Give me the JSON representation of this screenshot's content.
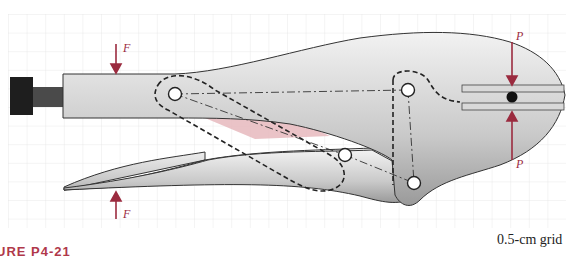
{
  "figure": {
    "caption": "URE P4-21",
    "grid_label": "0.5-cm grid",
    "forces": {
      "top_handle": "F",
      "bottom_handle": "F",
      "top_jaw": "P",
      "bottom_jaw": "P"
    },
    "colors": {
      "force_arrow": "#9b2b3f",
      "body_fill": "#c8c8c8",
      "outline": "#333333",
      "highlight_link": "#e6b8bd",
      "grid": "#e6e6e6",
      "knob": "#1e1e1e"
    }
  }
}
